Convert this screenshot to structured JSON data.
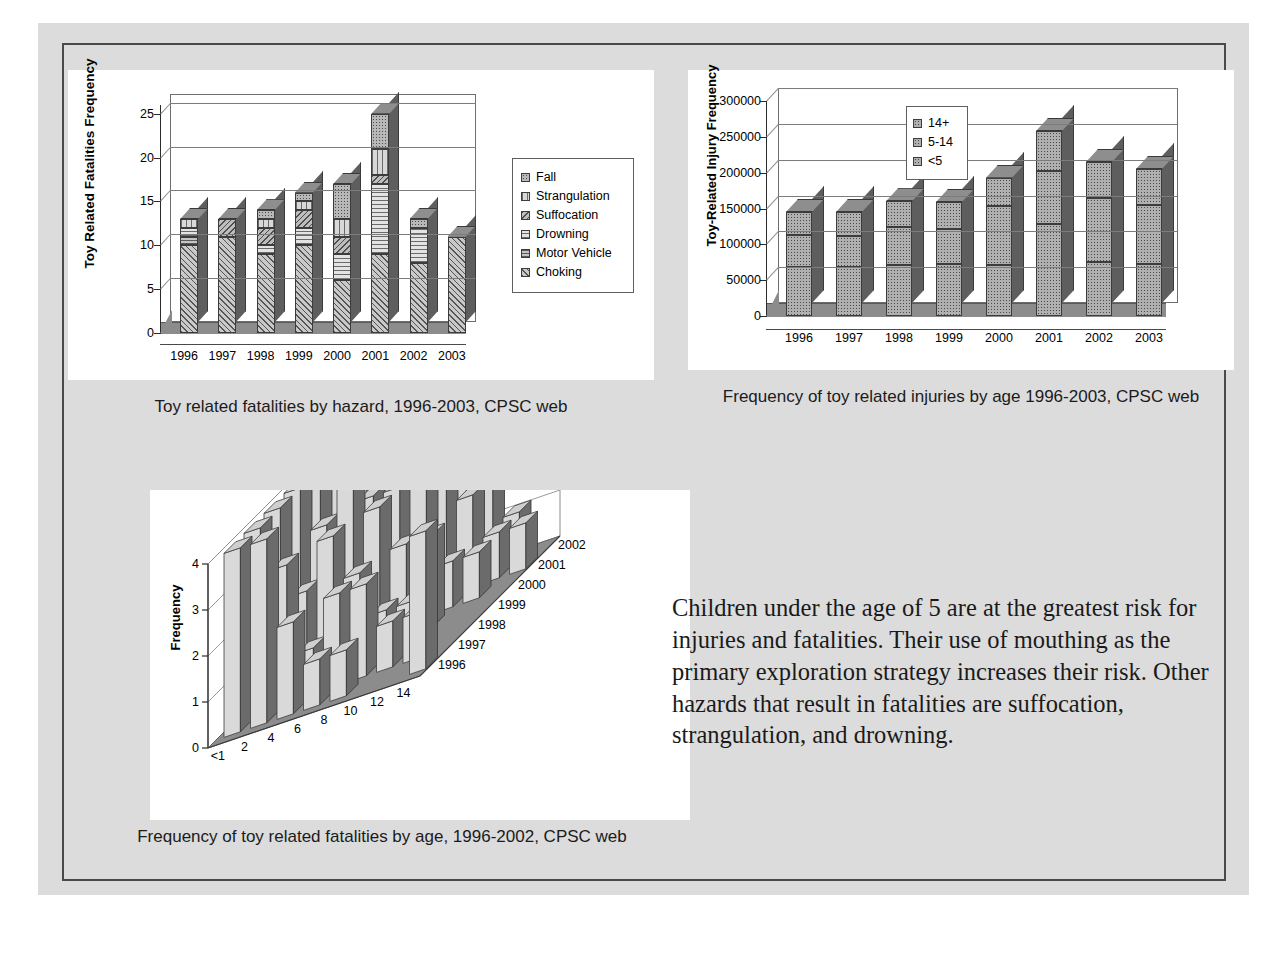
{
  "slide": {
    "background_color": "#dcdcdc",
    "frame_color": "#4a4a4a",
    "body_text": "Children under the age of 5 are at the greatest risk for injuries and fatalities. Their use of mouthing as the primary exploration strategy increases their risk. Other hazards that result in fatalities are suffocation, strangulation, and drowning."
  },
  "captions": {
    "chart1": "Toy related fatalities by hazard, 1996-2003, CPSC web",
    "chart2": "Frequency of toy related injuries by age 1996-2003, CPSC web",
    "chart3": "Frequency of toy related fatalities by age, 1996-2002, CPSC web"
  },
  "chart_data": [
    {
      "id": "fatalities-by-hazard",
      "type": "bar",
      "stacked": true,
      "three_d": true,
      "title": "",
      "xlabel": "",
      "ylabel": "Toy Related Fatalities Frequency",
      "ylim": [
        0,
        26
      ],
      "yticks": [
        0,
        5,
        10,
        15,
        20,
        25
      ],
      "ytick_labels": [
        "0",
        "5",
        "10",
        "15",
        "20",
        "25"
      ],
      "grid": true,
      "legend_position": "right",
      "categories": [
        "1996",
        "1997",
        "1998",
        "1999",
        "2000",
        "2001",
        "2002",
        "2003"
      ],
      "series": [
        {
          "name": "Choking",
          "values": [
            10,
            11,
            9,
            10,
            6,
            9,
            8,
            11
          ]
        },
        {
          "name": "Motor Vehicle",
          "values": [
            1,
            0,
            0,
            0,
            0,
            0,
            0,
            0
          ]
        },
        {
          "name": "Drowning",
          "values": [
            1,
            0,
            1,
            2,
            3,
            8,
            4,
            0
          ]
        },
        {
          "name": "Suffocation",
          "values": [
            0,
            2,
            2,
            2,
            2,
            1,
            0,
            0
          ]
        },
        {
          "name": "Strangulation",
          "values": [
            1,
            0,
            1,
            1,
            2,
            3,
            0,
            0
          ]
        },
        {
          "name": "Fall",
          "values": [
            0,
            0,
            1,
            1,
            4,
            4,
            1,
            0
          ]
        }
      ],
      "totals": [
        13,
        13,
        14,
        16,
        17,
        25,
        13,
        11
      ]
    },
    {
      "id": "injuries-by-age",
      "type": "bar",
      "stacked": true,
      "three_d": true,
      "title": "",
      "xlabel": "",
      "ylabel": "Toy-Related Injury Frequency",
      "ylim": [
        0,
        300000
      ],
      "yticks": [
        0,
        50000,
        100000,
        150000,
        200000,
        250000,
        300000
      ],
      "ytick_labels": [
        "0",
        "50000",
        "100000",
        "150000",
        "200000",
        "250000",
        "300000"
      ],
      "grid": true,
      "legend_position": "inside-top-left",
      "categories": [
        "1996",
        "1997",
        "1998",
        "1999",
        "2000",
        "2001",
        "2002",
        "2003"
      ],
      "series": [
        {
          "name": "<5",
          "values": [
            68000,
            69000,
            71000,
            72000,
            71000,
            128000,
            76000,
            73000
          ]
        },
        {
          "name": "5-14",
          "values": [
            45000,
            42000,
            53000,
            49000,
            83000,
            75000,
            89000,
            82000
          ]
        },
        {
          "name": "14+",
          "values": [
            32000,
            34000,
            36000,
            38000,
            39000,
            55000,
            50000,
            50000
          ]
        }
      ],
      "totals": [
        145000,
        145000,
        160000,
        159000,
        193000,
        258000,
        215000,
        205000
      ]
    },
    {
      "id": "fatalities-by-age-3d",
      "type": "bar",
      "three_d": true,
      "title": "",
      "xlabel": "",
      "ylabel": "Frequency",
      "zlabel": "",
      "ylim": [
        0,
        4
      ],
      "yticks": [
        0,
        1,
        2,
        3,
        4
      ],
      "ytick_labels": [
        "0",
        "1",
        "2",
        "3",
        "4"
      ],
      "grid": true,
      "x_categories": [
        "<1",
        "2",
        "4",
        "6",
        "8",
        "10",
        "12",
        "14"
      ],
      "x_tick_labels": [
        "<1",
        "2",
        "4",
        "6",
        "8",
        "10",
        "12",
        "14"
      ],
      "z_categories": [
        "1996",
        "1997",
        "1998",
        "1999",
        "2000",
        "2001",
        "2002"
      ],
      "series": [
        {
          "name": "1996",
          "values": [
            4,
            4,
            2,
            1,
            1,
            0,
            0,
            3
          ]
        },
        {
          "name": "1997",
          "values": [
            4,
            3,
            1,
            2,
            2,
            1,
            1,
            0
          ]
        },
        {
          "name": "1998",
          "values": [
            4,
            2,
            3,
            2,
            1,
            1,
            0,
            0
          ]
        },
        {
          "name": "1999",
          "values": [
            4,
            3,
            4,
            3,
            2,
            2,
            0,
            0
          ]
        },
        {
          "name": "2000",
          "values": [
            4,
            2,
            3,
            3,
            4,
            1,
            1,
            0
          ]
        },
        {
          "name": "2001",
          "values": [
            4,
            3,
            4,
            4,
            3,
            2,
            1,
            1
          ]
        },
        {
          "name": "2002",
          "values": [
            4,
            3,
            2,
            3,
            2,
            3,
            1,
            0
          ]
        }
      ]
    }
  ],
  "chart1_legend": [
    {
      "label": "Fall",
      "pattern": "fall"
    },
    {
      "label": "Strangulation",
      "pattern": "strangulation"
    },
    {
      "label": "Suffocation",
      "pattern": "suffocation"
    },
    {
      "label": "Drowning",
      "pattern": "drowning"
    },
    {
      "label": "Motor Vehicle",
      "pattern": "motor"
    },
    {
      "label": "Choking",
      "pattern": "choking"
    }
  ],
  "chart2_legend": [
    {
      "label": "14+",
      "pattern": "gray"
    },
    {
      "label": "5-14",
      "pattern": "gray"
    },
    {
      "label": "<5",
      "pattern": "gray"
    }
  ]
}
